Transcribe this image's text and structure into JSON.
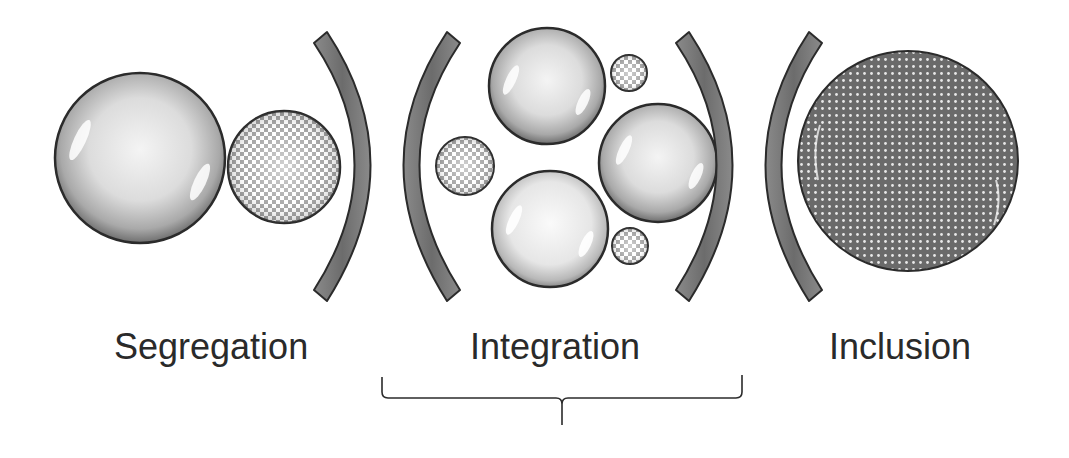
{
  "diagram": {
    "stages": [
      {
        "label": "Segregation",
        "description": "Large plain sphere separated from small checkered sphere"
      },
      {
        "label": "Integration",
        "description": "Plain spheres mixed with small checkered spheres within brackets"
      },
      {
        "label": "Inclusion",
        "description": "Single large sphere with uniform dotted pattern"
      }
    ],
    "brace": {
      "spans_stage": "Integration"
    },
    "colors": {
      "outline": "#2b2b2b",
      "arc_fill": "#777777",
      "sphere_light": "#f2f2f2",
      "sphere_dark": "#7a7a7a",
      "background": "#ffffff"
    }
  }
}
